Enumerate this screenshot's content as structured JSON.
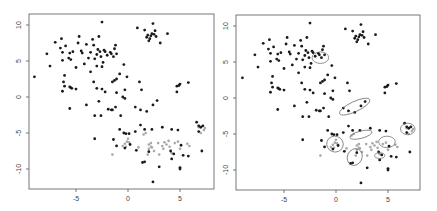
{
  "chart_data": [
    {
      "type": "scatter",
      "title": "",
      "xlabel": "",
      "ylabel": "",
      "xlim": [
        -9.3,
        8.0
      ],
      "ylim": [
        -12.3,
        10.8
      ],
      "xticks": [
        -5,
        0,
        5
      ],
      "yticks": [
        -10,
        -5,
        0,
        5,
        10
      ],
      "xtick_labels": [
        "-5",
        "0",
        "5"
      ],
      "ytick_labels": [
        "-10",
        "-5",
        "0",
        "5",
        "10"
      ],
      "grid": false,
      "series": [
        {
          "name": "black",
          "color": "#1a1a1a",
          "points": [
            [
              -9,
              2.8
            ],
            [
              -7.5,
              4.3
            ],
            [
              -7.8,
              6
            ],
            [
              -7,
              7.6
            ],
            [
              -6.5,
              6.8
            ],
            [
              -6.4,
              8.1
            ],
            [
              -6.3,
              6.2
            ],
            [
              -6.3,
              5.1
            ],
            [
              -6.1,
              3
            ],
            [
              -6,
              7.1
            ],
            [
              -5.7,
              5.4
            ],
            [
              -5.6,
              6.1
            ],
            [
              -5.5,
              5.2
            ],
            [
              -5.3,
              6.3
            ],
            [
              -5,
              4.1
            ],
            [
              -4.8,
              7.5
            ],
            [
              -4.7,
              8.4
            ],
            [
              -4.5,
              6.4
            ],
            [
              -4.4,
              6.1
            ],
            [
              -4.2,
              4.6
            ],
            [
              -4,
              7.3
            ],
            [
              -3.8,
              5.4
            ],
            [
              -3.6,
              6.2
            ],
            [
              -3.4,
              8
            ],
            [
              -3.3,
              7.2
            ],
            [
              -3.2,
              5.3
            ],
            [
              -3,
              5.9
            ],
            [
              -3,
              4.3
            ],
            [
              -2.9,
              6.6
            ],
            [
              -2.8,
              8.4
            ],
            [
              -2.7,
              6.3
            ],
            [
              -2.6,
              5.6
            ],
            [
              -2.5,
              4.2
            ],
            [
              -2.4,
              4.8
            ],
            [
              -2.3,
              6.5
            ],
            [
              -2.2,
              6.3
            ],
            [
              -2,
              5.8
            ],
            [
              -1.7,
              6.2
            ],
            [
              -1.6,
              6
            ],
            [
              -1.4,
              5.6
            ],
            [
              -1.3,
              6.7
            ],
            [
              -1.2,
              7.2
            ],
            [
              -1.1,
              6
            ],
            [
              -2.5,
              10.4
            ],
            [
              -3.6,
              3.5
            ],
            [
              -6.2,
              2.1
            ],
            [
              -6.1,
              1.5
            ],
            [
              -6.3,
              0.8
            ],
            [
              -5.6,
              1.4
            ],
            [
              -5.5,
              1.3
            ],
            [
              -5.4,
              1.2
            ],
            [
              -5,
              1.1
            ],
            [
              -5.6,
              -1.6
            ],
            [
              -4,
              -1.1
            ],
            [
              -3.3,
              2.1
            ],
            [
              -3,
              1.2
            ],
            [
              -2.8,
              -0.6
            ],
            [
              -2.5,
              1.1
            ],
            [
              -2.2,
              0.7
            ],
            [
              -1.9,
              -1.7
            ],
            [
              -1.6,
              -1.8
            ],
            [
              -1.5,
              -1.8
            ],
            [
              -1.2,
              -1.4
            ],
            [
              -1.1,
              0.6
            ],
            [
              -1.3,
              2.3
            ],
            [
              -1.5,
              2.1
            ],
            [
              -1.1,
              2.5
            ],
            [
              -0.8,
              3.2
            ],
            [
              -0.4,
              4.5
            ],
            [
              -0.3,
              1
            ],
            [
              -0.5,
              0
            ],
            [
              -0.3,
              -0.2
            ],
            [
              -0.7,
              -2.6
            ],
            [
              -2.6,
              -2.6
            ],
            [
              -3.2,
              -2.6
            ],
            [
              -0.1,
              2.8
            ],
            [
              1.1,
              2.1
            ],
            [
              1.3,
              1
            ],
            [
              0.7,
              -1.4
            ],
            [
              1.2,
              -1.8
            ],
            [
              1.8,
              -2
            ],
            [
              2.4,
              -1.1
            ],
            [
              2.8,
              -0.5
            ],
            [
              0.9,
              9.6
            ],
            [
              1.6,
              9.3
            ],
            [
              1.8,
              8.3
            ],
            [
              1.9,
              8.6
            ],
            [
              2.1,
              8.1
            ],
            [
              2.2,
              8.5
            ],
            [
              2.3,
              8.8
            ],
            [
              2.4,
              10.2
            ],
            [
              2.5,
              8.7
            ],
            [
              2.6,
              9.2
            ],
            [
              2.0,
              7.8
            ],
            [
              2.7,
              8.4
            ],
            [
              3.1,
              7.5
            ],
            [
              3.8,
              8.8
            ],
            [
              4.7,
              1.5
            ],
            [
              4.9,
              1.6
            ],
            [
              5.0,
              1.8
            ],
            [
              4.7,
              0.7
            ],
            [
              5.8,
              2.0
            ],
            [
              -0.8,
              -4.5
            ],
            [
              -0.4,
              -5
            ],
            [
              -0.2,
              -5.1
            ],
            [
              0.1,
              -5.1
            ],
            [
              -1.4,
              -5.9
            ],
            [
              -1.1,
              -6.8
            ],
            [
              -0.3,
              -7.1
            ],
            [
              0.2,
              -6.6
            ],
            [
              0.7,
              -4.8
            ],
            [
              1.2,
              -3.9
            ],
            [
              1.6,
              -4.5
            ],
            [
              2.3,
              -4.5
            ],
            [
              3.3,
              -4.2
            ],
            [
              4.2,
              -4.5
            ],
            [
              4.8,
              -4.6
            ],
            [
              4.4,
              -7.9
            ],
            [
              4.2,
              -8.6
            ],
            [
              4.1,
              -7.5
            ],
            [
              5.1,
              -6.7
            ],
            [
              5.3,
              -8.1
            ],
            [
              5.8,
              -8.2
            ],
            [
              5.0,
              -9.8
            ],
            [
              5.0,
              -10
            ],
            [
              3.0,
              -9.7
            ],
            [
              1.4,
              -9.1
            ],
            [
              1.6,
              -9
            ],
            [
              2.4,
              -11.8
            ],
            [
              7.1,
              -7.5
            ],
            [
              0.8,
              -7.4
            ],
            [
              -3.2,
              -5.8
            ],
            [
              2.0,
              -7.6
            ],
            [
              6.6,
              -3.5
            ],
            [
              6.8,
              -4
            ],
            [
              7.0,
              -4.2
            ],
            [
              7.2,
              -4
            ],
            [
              6.8,
              -4.8
            ]
          ]
        },
        {
          "name": "gray",
          "color": "#a8a8a8",
          "points": [
            [
              -1.5,
              -8
            ],
            [
              -0.5,
              -6.8
            ],
            [
              -0.3,
              -6.5
            ],
            [
              -0.1,
              -6.2
            ],
            [
              0.0,
              -5.8
            ],
            [
              0.1,
              -6.3
            ],
            [
              -0.2,
              -6.9
            ],
            [
              1.0,
              -7
            ],
            [
              1.5,
              -5.2
            ],
            [
              1.7,
              -5
            ],
            [
              2.0,
              -6.6
            ],
            [
              2.0,
              -7.2
            ],
            [
              2.3,
              -7
            ],
            [
              2.2,
              -6.4
            ],
            [
              2.5,
              -7.5
            ],
            [
              2.9,
              -6.4
            ],
            [
              3.0,
              -8
            ],
            [
              3.3,
              -6.8
            ],
            [
              3.5,
              -6.3
            ],
            [
              3.7,
              -6.6
            ],
            [
              3.9,
              -6.1
            ],
            [
              4.0,
              -6.9
            ],
            [
              4.2,
              -7.8
            ],
            [
              4.5,
              -6.4
            ],
            [
              4.8,
              -6.2
            ],
            [
              5.0,
              -7.2
            ],
            [
              5.7,
              -6.5
            ],
            [
              5.9,
              -6.8
            ],
            [
              6.8,
              -4.2
            ],
            [
              7.3,
              -4.6
            ],
            [
              7.4,
              -4.3
            ],
            [
              7.0,
              -5
            ],
            [
              2.2,
              -6.9
            ],
            [
              1.9,
              -8
            ],
            [
              3.4,
              -7.2
            ]
          ]
        }
      ],
      "ellipses": []
    },
    {
      "type": "scatter",
      "title": "",
      "xlabel": "",
      "ylabel": "",
      "xlim": [
        -9.3,
        8.0
      ],
      "ylim": [
        -12.3,
        10.8
      ],
      "xticks": [
        -5,
        0,
        5
      ],
      "yticks": [
        -10,
        -5,
        0,
        5,
        10
      ],
      "xtick_labels": [
        "-5",
        "0",
        "5"
      ],
      "ytick_labels": [
        "-10",
        "-5",
        "0",
        "5",
        "10"
      ],
      "grid": false,
      "series_same_as_left": true,
      "ellipses": [
        {
          "cx": -1.5,
          "cy": 5.6,
          "rx": 0.8,
          "ry": 0.8,
          "angle": 0
        },
        {
          "cx": 1.8,
          "cy": -1.2,
          "rx": 1.6,
          "ry": 0.7,
          "angle": -25
        },
        {
          "cx": -0.1,
          "cy": -6.4,
          "rx": 0.8,
          "ry": 1.1,
          "angle": 20
        },
        {
          "cx": 2.4,
          "cy": -5.1,
          "rx": 1.1,
          "ry": 0.5,
          "angle": -15
        },
        {
          "cx": 1.8,
          "cy": -8.2,
          "rx": 0.7,
          "ry": 1.2,
          "angle": 25
        },
        {
          "cx": 4.9,
          "cy": -6.1,
          "rx": 0.8,
          "ry": 0.8,
          "angle": 0
        },
        {
          "cx": 4.2,
          "cy": -8.0,
          "rx": 0.5,
          "ry": 0.4,
          "angle": 0
        },
        {
          "cx": 6.9,
          "cy": -4.3,
          "rx": 0.7,
          "ry": 0.8,
          "angle": 0
        }
      ]
    }
  ]
}
